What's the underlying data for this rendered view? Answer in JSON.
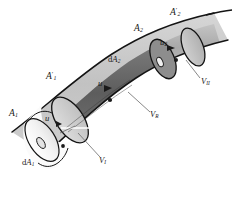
{
  "figure": {
    "background_color": "#ffffff",
    "stroke_color": "#1a1a1a",
    "colors": {
      "tube_mid_dark": "#656565",
      "tube_light_gray": "#c9c9c9",
      "tube_mid_gray": "#a8a8a8",
      "cap_white": "#f4f4f4",
      "cap_light": "#d2d2d2",
      "cap_right": "#b5b5b5",
      "highlight_white": "#ffffff"
    }
  },
  "labels": {
    "area_1": {
      "base": "A",
      "sub": "1",
      "prime": ""
    },
    "area_1_prime": {
      "base": "A",
      "sub": "1",
      "prime": "′"
    },
    "area_2": {
      "base": "A",
      "sub": "2",
      "prime": ""
    },
    "area_2_prime": {
      "base": "A",
      "sub": "2",
      "prime": "′"
    },
    "dA_1": {
      "d": "d",
      "base": "A",
      "sub": "1"
    },
    "dA_2": {
      "d": "d",
      "base": "A",
      "sub": "2"
    },
    "u_left": {
      "base": "u",
      "sub": ""
    },
    "u_mid": {
      "base": "u",
      "sub": ""
    },
    "u_2": {
      "base": "u",
      "sub": "2"
    },
    "V_1": {
      "base": "V",
      "sub": "I"
    },
    "V_R": {
      "base": "V",
      "sub": "R"
    },
    "V_2": {
      "base": "V",
      "sub": "II"
    }
  },
  "label_text": {
    "area_1": "A",
    "area_1_sub": "1",
    "area_1p": "A",
    "area_1p_sub": "1",
    "area_1p_prime": "′",
    "area_2": "A",
    "area_2_sub": "2",
    "area_2p": "A",
    "area_2p_sub": "2",
    "area_2p_prime": "′",
    "dA1_d": "d",
    "dA1_A": "A",
    "dA1_sub": "1",
    "dA2_d": "d",
    "dA2_A": "A",
    "dA2_sub": "2",
    "u_left": "u",
    "u_mid": "u",
    "u2_base": "u",
    "u2_sub": "2",
    "V1_base": "V",
    "V1_sub": "I",
    "VR_base": "V",
    "VR_sub": "R",
    "V2_base": "V",
    "V2_sub": "II"
  }
}
